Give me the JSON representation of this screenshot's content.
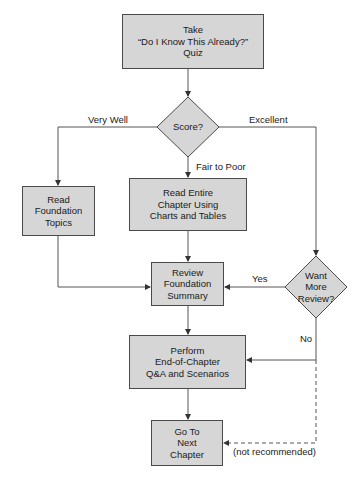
{
  "diagram": {
    "type": "flowchart",
    "nodes": {
      "take_quiz": {
        "shape": "rect",
        "text": "Take\n“Do I Know This Already?”\nQuiz"
      },
      "score": {
        "shape": "diamond",
        "text": "Score?"
      },
      "read_foundation": {
        "shape": "rect",
        "text": "Read\nFoundation\nTopics"
      },
      "read_entire": {
        "shape": "rect",
        "text": "Read Entire\nChapter Using\nCharts and Tables"
      },
      "review_summary": {
        "shape": "rect",
        "text": "Review\nFoundation\nSummary"
      },
      "want_more": {
        "shape": "diamond",
        "text": "Want\nMore\nReview?"
      },
      "perform_qa": {
        "shape": "rect",
        "text": "Perform\nEnd-of-Chapter\nQ&A and Scenarios"
      },
      "next_chapter": {
        "shape": "rect",
        "text": "Go To\nNext\nChapter"
      }
    },
    "edge_labels": {
      "very_well": "Very Well",
      "excellent": "Excellent",
      "fair_to_poor": "Fair to Poor",
      "yes": "Yes",
      "no": "No",
      "not_recommended": "(not recommended)"
    },
    "edges": [
      {
        "from": "take_quiz",
        "to": "score"
      },
      {
        "from": "score",
        "to": "read_foundation",
        "label": "Very Well"
      },
      {
        "from": "score",
        "to": "read_entire",
        "label": "Fair to Poor"
      },
      {
        "from": "score",
        "to": "want_more",
        "label": "Excellent"
      },
      {
        "from": "read_foundation",
        "to": "review_summary"
      },
      {
        "from": "read_entire",
        "to": "review_summary"
      },
      {
        "from": "want_more",
        "to": "review_summary",
        "label": "Yes"
      },
      {
        "from": "want_more",
        "to": "perform_qa",
        "label": "No"
      },
      {
        "from": "want_more",
        "to": "next_chapter",
        "label": "(not recommended)",
        "style": "dashed"
      },
      {
        "from": "review_summary",
        "to": "perform_qa"
      },
      {
        "from": "perform_qa",
        "to": "next_chapter"
      }
    ],
    "colors": {
      "fill": "#d6d6d6",
      "stroke": "#4a4a4a",
      "text": "#1a1a1a"
    }
  }
}
